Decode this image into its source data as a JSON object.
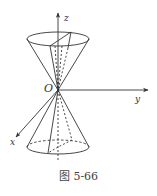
{
  "figure": {
    "caption": "图 5-66",
    "labels": {
      "origin": "O",
      "x_axis": "x",
      "y_axis": "y",
      "z_axis": "z"
    },
    "colors": {
      "stroke": "#333333",
      "background": "#ffffff"
    }
  }
}
